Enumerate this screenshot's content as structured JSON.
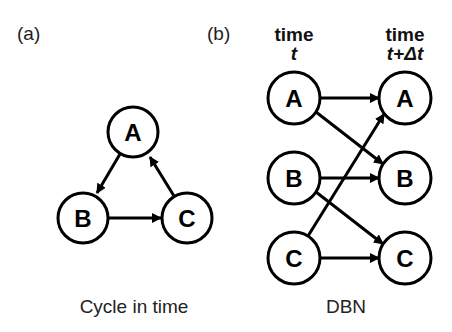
{
  "colors": {
    "background": "#ffffff",
    "stroke": "#000000",
    "text": "#222222"
  },
  "panel_a": {
    "label": "(a)",
    "caption": "Cycle in time",
    "nodes": [
      {
        "id": "A",
        "label": "A",
        "cx": 133,
        "cy": 132
      },
      {
        "id": "B",
        "label": "B",
        "cx": 83,
        "cy": 218
      },
      {
        "id": "C",
        "label": "C",
        "cx": 187,
        "cy": 218
      }
    ],
    "edges": [
      {
        "from": "A",
        "to": "B"
      },
      {
        "from": "B",
        "to": "C"
      },
      {
        "from": "C",
        "to": "A"
      }
    ]
  },
  "panel_b": {
    "label": "(b)",
    "caption": "DBN",
    "columns": [
      {
        "head": "time",
        "sub": "t"
      },
      {
        "head": "time",
        "sub": "t+Δt"
      }
    ],
    "nodes_t": [
      {
        "id": "A_t",
        "label": "A",
        "cx": 294,
        "cy": 98
      },
      {
        "id": "B_t",
        "label": "B",
        "cx": 294,
        "cy": 178
      },
      {
        "id": "C_t",
        "label": "C",
        "cx": 294,
        "cy": 258
      }
    ],
    "nodes_t_dt": [
      {
        "id": "A_tdt",
        "label": "A",
        "cx": 405,
        "cy": 98
      },
      {
        "id": "B_tdt",
        "label": "B",
        "cx": 405,
        "cy": 178
      },
      {
        "id": "C_tdt",
        "label": "C",
        "cx": 405,
        "cy": 258
      }
    ],
    "edges": [
      {
        "from": "A_t",
        "to": "A_tdt"
      },
      {
        "from": "A_t",
        "to": "B_tdt"
      },
      {
        "from": "B_t",
        "to": "B_tdt"
      },
      {
        "from": "B_t",
        "to": "C_tdt"
      },
      {
        "from": "C_t",
        "to": "C_tdt"
      },
      {
        "from": "C_t",
        "to": "A_tdt"
      }
    ]
  }
}
